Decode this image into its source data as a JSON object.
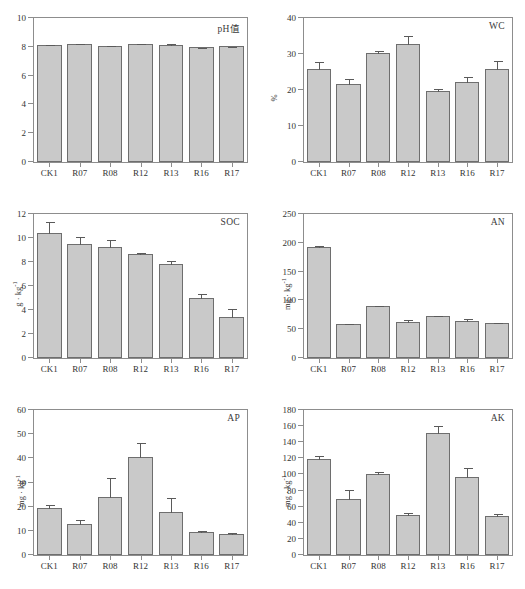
{
  "figure": {
    "categories": [
      "CK1",
      "R07",
      "R08",
      "R12",
      "R13",
      "R16",
      "R17"
    ],
    "bar_color": "#c9c9c9",
    "bar_border_color": "#6e6e6e",
    "axis_color": "#8d8d8d"
  },
  "chart_data": [
    {
      "type": "bar",
      "title": "pH值",
      "xlabel": "",
      "ylabel": "",
      "categories": [
        "CK1",
        "R07",
        "R08",
        "R12",
        "R13",
        "R16",
        "R17"
      ],
      "values": [
        8.12,
        8.18,
        8.07,
        8.18,
        8.15,
        7.98,
        8.04
      ],
      "errors": [
        0.05,
        0.06,
        0.04,
        0.08,
        0.09,
        0.04,
        0.05
      ],
      "ylim": [
        0,
        10
      ],
      "yticks": [
        0,
        2,
        4,
        6,
        8,
        10
      ],
      "grid": false,
      "legend": "none"
    },
    {
      "type": "bar",
      "title": "WC",
      "xlabel": "",
      "ylabel": "%",
      "categories": [
        "CK1",
        "R07",
        "R08",
        "R12",
        "R13",
        "R16",
        "R17"
      ],
      "values": [
        25.8,
        21.6,
        30.3,
        32.7,
        19.7,
        22.1,
        25.8
      ],
      "errors": [
        2.3,
        1.7,
        0.8,
        2.6,
        0.9,
        1.9,
        2.6
      ],
      "ylim": [
        0,
        40
      ],
      "yticks": [
        0,
        10,
        20,
        30,
        40
      ],
      "grid": false,
      "legend": "none"
    },
    {
      "type": "bar",
      "title": "SOC",
      "xlabel": "",
      "ylabel": "g · kg⁻¹",
      "categories": [
        "CK1",
        "R07",
        "R08",
        "R12",
        "R13",
        "R16",
        "R17"
      ],
      "values": [
        10.45,
        9.5,
        9.25,
        8.7,
        7.85,
        5.0,
        3.4
      ],
      "errors": [
        0.95,
        0.7,
        0.65,
        0.15,
        0.35,
        0.45,
        0.85
      ],
      "ylim": [
        0,
        12
      ],
      "yticks": [
        0,
        2,
        4,
        6,
        8,
        10,
        12
      ],
      "grid": false,
      "legend": "none"
    },
    {
      "type": "bar",
      "title": "AN",
      "xlabel": "",
      "ylabel": "mg · kg⁻¹",
      "categories": [
        "CK1",
        "R07",
        "R08",
        "R12",
        "R13",
        "R16",
        "R17"
      ],
      "values": [
        192,
        59,
        90,
        62,
        73,
        64,
        60
      ],
      "errors": [
        5,
        2.5,
        1.5,
        6,
        1.5,
        6,
        3
      ],
      "ylim": [
        0,
        250
      ],
      "yticks": [
        0,
        50,
        100,
        150,
        200,
        250
      ],
      "grid": false,
      "legend": "none"
    },
    {
      "type": "bar",
      "title": "AP",
      "xlabel": "",
      "ylabel": "mg · kg⁻¹",
      "categories": [
        "CK1",
        "R07",
        "R08",
        "R12",
        "R13",
        "R16",
        "R17"
      ],
      "values": [
        19.5,
        12.7,
        24.1,
        40.5,
        17.8,
        9.4,
        8.9
      ],
      "errors": [
        1.7,
        2.4,
        8.4,
        6.3,
        6.4,
        0.9,
        0.9
      ],
      "ylim": [
        0,
        60
      ],
      "yticks": [
        0,
        10,
        20,
        30,
        40,
        50,
        60
      ],
      "grid": false,
      "legend": "none"
    },
    {
      "type": "bar",
      "title": "AK",
      "xlabel": "",
      "ylabel": "mg · kg⁻¹",
      "categories": [
        "CK1",
        "R07",
        "R08",
        "R12",
        "R13",
        "R16",
        "R17"
      ],
      "values": [
        119.5,
        70.0,
        101.0,
        50.0,
        151.0,
        97.0,
        48.0
      ],
      "errors": [
        4.5,
        13.0,
        3.0,
        4.0,
        11.0,
        13.0,
        4.5
      ],
      "ylim": [
        0,
        180
      ],
      "yticks": [
        0,
        20,
        40,
        60,
        80,
        100,
        120,
        140,
        160,
        180
      ],
      "grid": false,
      "legend": "none"
    }
  ]
}
